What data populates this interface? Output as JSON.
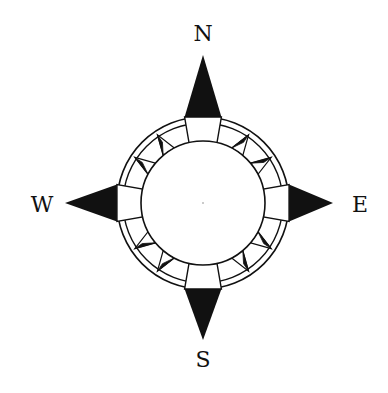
{
  "diagram": {
    "type": "compass-rose",
    "background": "#ffffff",
    "ink": "#111111",
    "center": {
      "x": 203,
      "y": 203
    },
    "inner_radius": 62,
    "ring_radii": [
      80,
      86
    ],
    "teeth_per_quadrant": 4,
    "arms": {
      "north": {
        "tip_y": 55,
        "base_half_width": 18,
        "base_offset": 90
      },
      "south": {
        "tip_y": 340,
        "base_half_width": 18,
        "base_offset": 90
      },
      "west": {
        "tip_x": 65,
        "base_half_width": 18,
        "base_offset": 90
      },
      "east": {
        "tip_x": 333,
        "base_half_width": 18,
        "base_offset": 90
      }
    }
  },
  "labels": {
    "north": {
      "text": "N",
      "x": 203,
      "y": 34
    },
    "south": {
      "text": "S",
      "x": 203,
      "y": 360
    },
    "west": {
      "text": "W",
      "x": 42,
      "y": 205
    },
    "east": {
      "text": "E",
      "x": 360,
      "y": 205
    }
  }
}
